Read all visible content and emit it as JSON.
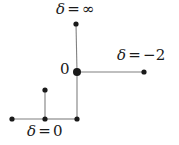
{
  "figure": {
    "type": "node-edge-diagram",
    "width": 179,
    "height": 145,
    "background_color": "#ffffff",
    "edge_color": "#808080",
    "node_color": "#1a1a1a",
    "text_color": "#1a1a1a"
  },
  "labels": {
    "delta_infinity": {
      "symbol": "δ",
      "operator": "=",
      "value": "∞",
      "full": "δ = ∞"
    },
    "delta_minus_two": {
      "symbol": "δ",
      "operator": "=",
      "value": "−2",
      "full": "δ = −2"
    },
    "delta_zero": {
      "symbol": "δ",
      "operator": "=",
      "value": "0",
      "full": "δ = 0"
    },
    "origin": {
      "value": "0"
    }
  },
  "chart_data": {
    "type": "scatter",
    "title": "",
    "xlabel": "",
    "ylabel": "",
    "nodes": [
      {
        "id": "top",
        "x": 76,
        "y": 24,
        "radius": 2.6,
        "filled": true,
        "label": "δ = ∞"
      },
      {
        "id": "origin",
        "x": 77,
        "y": 72,
        "radius": 4.0,
        "filled": true,
        "label": "0"
      },
      {
        "id": "right",
        "x": 144,
        "y": 72,
        "radius": 2.6,
        "filled": true,
        "label": "δ = −2"
      },
      {
        "id": "branch-top",
        "x": 45,
        "y": 90,
        "radius": 2.6,
        "filled": true,
        "label": ""
      },
      {
        "id": "left-end",
        "x": 12,
        "y": 119,
        "radius": 2.6,
        "filled": true,
        "label": ""
      },
      {
        "id": "branch-base",
        "x": 45,
        "y": 119,
        "radius": 2.6,
        "filled": true,
        "label": ""
      },
      {
        "id": "bottom",
        "x": 77,
        "y": 119,
        "radius": 2.6,
        "filled": true,
        "label": "δ = 0"
      }
    ],
    "edges": [
      {
        "from": "top",
        "to": "origin"
      },
      {
        "from": "origin",
        "to": "right"
      },
      {
        "from": "origin",
        "to": "bottom"
      },
      {
        "from": "left-end",
        "to": "branch-base"
      },
      {
        "from": "branch-base",
        "to": "bottom"
      },
      {
        "from": "branch-top",
        "to": "branch-base"
      }
    ]
  }
}
